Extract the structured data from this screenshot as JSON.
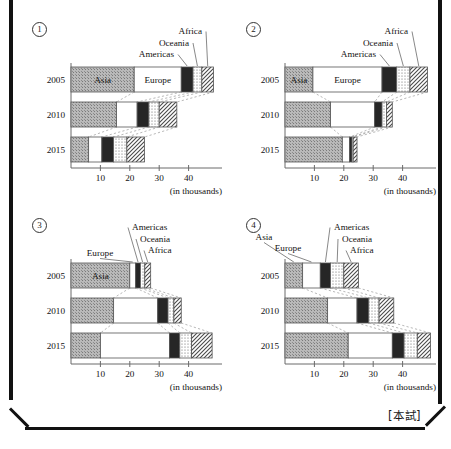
{
  "page": {
    "source_stamp": "[本試]"
  },
  "legend_series": [
    "Asia",
    "Europe",
    "Americas",
    "Oceania",
    "Africa"
  ],
  "axis": {
    "ticks": [
      10,
      20,
      30,
      40
    ],
    "tick_labels": [
      "10",
      "20",
      "30",
      "40"
    ],
    "units_caption": "(in thousands)",
    "xmin": 0,
    "xmax": 50
  },
  "years": [
    "2005",
    "2010",
    "2015"
  ],
  "panels": [
    {
      "number": "1",
      "number_glyph": "①"
    },
    {
      "number": "2",
      "number_glyph": "②"
    },
    {
      "number": "3",
      "number_glyph": "③"
    },
    {
      "number": "4",
      "number_glyph": "④"
    }
  ],
  "chart_data": [
    {
      "id": "chart-1",
      "type": "bar",
      "orientation": "horizontal",
      "stacked": true,
      "title": "①",
      "xlabel": "(in thousands)",
      "ylabel": "",
      "xlim": [
        0,
        50
      ],
      "xticks": [
        10,
        20,
        30,
        40
      ],
      "grid": false,
      "legend": "inline-callout",
      "categories": [
        "2005",
        "2010",
        "2015"
      ],
      "series": [
        {
          "name": "Asia",
          "values": [
            21.5,
            15.5,
            6.0
          ]
        },
        {
          "name": "Europe",
          "values": [
            16.0,
            7.0,
            4.5
          ]
        },
        {
          "name": "Americas",
          "values": [
            4.0,
            4.0,
            4.0
          ]
        },
        {
          "name": "Oceania",
          "values": [
            3.0,
            3.5,
            4.5
          ]
        },
        {
          "name": "Africa",
          "values": [
            4.0,
            6.0,
            6.0
          ]
        }
      ],
      "totals": [
        48.5,
        36.0,
        25.0
      ]
    },
    {
      "id": "chart-2",
      "type": "bar",
      "orientation": "horizontal",
      "stacked": true,
      "title": "②",
      "xlabel": "(in thousands)",
      "ylabel": "",
      "xlim": [
        0,
        50
      ],
      "xticks": [
        10,
        20,
        30,
        40
      ],
      "grid": false,
      "legend": "inline-callout",
      "categories": [
        "2005",
        "2010",
        "2015"
      ],
      "series": [
        {
          "name": "Asia",
          "values": [
            9.5,
            15.5,
            19.5
          ]
        },
        {
          "name": "Europe",
          "values": [
            23.5,
            15.0,
            2.5
          ]
        },
        {
          "name": "Americas",
          "values": [
            5.0,
            2.5,
            0.8
          ]
        },
        {
          "name": "Oceania",
          "values": [
            4.5,
            1.5,
            0.4
          ]
        },
        {
          "name": "Africa",
          "values": [
            6.0,
            2.0,
            1.3
          ]
        }
      ],
      "totals": [
        48.5,
        36.5,
        24.5
      ]
    },
    {
      "id": "chart-3",
      "type": "bar",
      "orientation": "horizontal",
      "stacked": true,
      "title": "③",
      "xlabel": "(in thousands)",
      "ylabel": "",
      "xlim": [
        0,
        50
      ],
      "xticks": [
        10,
        20,
        30,
        40
      ],
      "grid": false,
      "legend": "inline-callout",
      "categories": [
        "2005",
        "2010",
        "2015"
      ],
      "series": [
        {
          "name": "Asia",
          "values": [
            20.0,
            14.5,
            10.0
          ]
        },
        {
          "name": "Europe",
          "values": [
            2.0,
            15.0,
            23.5
          ]
        },
        {
          "name": "Americas",
          "values": [
            1.6,
            3.5,
            3.5
          ]
        },
        {
          "name": "Oceania",
          "values": [
            1.5,
            2.0,
            4.0
          ]
        },
        {
          "name": "Africa",
          "values": [
            2.0,
            2.5,
            7.0
          ]
        }
      ],
      "totals": [
        27.1,
        37.5,
        48.0
      ]
    },
    {
      "id": "chart-4",
      "type": "bar",
      "orientation": "horizontal",
      "stacked": true,
      "title": "④",
      "xlabel": "(in thousands)",
      "ylabel": "",
      "xlim": [
        0,
        50
      ],
      "xticks": [
        10,
        20,
        30,
        40
      ],
      "grid": false,
      "legend": "inline-callout",
      "categories": [
        "2005",
        "2010",
        "2015"
      ],
      "series": [
        {
          "name": "Asia",
          "values": [
            6.0,
            14.5,
            21.5
          ]
        },
        {
          "name": "Europe",
          "values": [
            6.0,
            10.0,
            15.0
          ]
        },
        {
          "name": "Americas",
          "values": [
            3.5,
            4.0,
            4.0
          ]
        },
        {
          "name": "Oceania",
          "values": [
            4.5,
            3.5,
            4.5
          ]
        },
        {
          "name": "Africa",
          "values": [
            5.0,
            5.0,
            4.5
          ]
        }
      ],
      "totals": [
        25.0,
        37.0,
        49.5
      ]
    }
  ]
}
